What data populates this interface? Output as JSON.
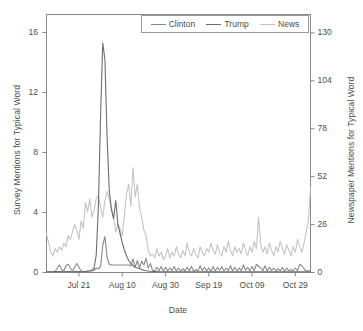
{
  "chart_data": {
    "type": "line",
    "title": "",
    "xlabel": "Date",
    "ylabel": "Survey Mentions for Typical Word",
    "ylabel_right": "Newspaper Mentions for Typical Word",
    "grid": false,
    "legend_position": "top",
    "xlim": [
      0,
      122
    ],
    "ylim": [
      0,
      17.2
    ],
    "ylim_right": [
      0,
      140
    ],
    "xticks": [
      {
        "value": 15,
        "label": "Jul 21"
      },
      {
        "value": 35,
        "label": "Aug 10"
      },
      {
        "value": 55,
        "label": "Aug 30"
      },
      {
        "value": 75,
        "label": "Sep 19"
      },
      {
        "value": 95,
        "label": "Oct 09"
      },
      {
        "value": 115,
        "label": "Oct 29"
      }
    ],
    "yticks_left": [
      {
        "value": 0,
        "label": "0"
      },
      {
        "value": 4,
        "label": "4"
      },
      {
        "value": 8,
        "label": "8"
      },
      {
        "value": 12,
        "label": "12"
      },
      {
        "value": 16,
        "label": "16"
      }
    ],
    "yticks_right": [
      {
        "value": 0,
        "label": "0"
      },
      {
        "value": 26,
        "label": "26"
      },
      {
        "value": 52,
        "label": "52"
      },
      {
        "value": 78,
        "label": "78"
      },
      {
        "value": 104,
        "label": "104"
      },
      {
        "value": 130,
        "label": "130"
      }
    ],
    "series": [
      {
        "name": "Clinton",
        "color": "#8a8a8a",
        "axis": "left",
        "x": [
          0,
          1,
          2,
          3,
          4,
          5,
          6,
          7,
          8,
          9,
          10,
          11,
          12,
          13,
          14,
          15,
          16,
          17,
          18,
          19,
          20,
          21,
          22,
          23,
          24,
          25,
          26,
          27,
          28,
          29,
          30,
          31,
          32,
          33,
          34,
          35,
          36,
          37,
          38,
          39,
          40,
          41,
          42,
          43,
          44,
          45,
          46,
          47,
          48,
          49,
          50,
          51,
          52,
          53,
          54,
          55,
          56,
          57,
          58,
          59,
          60,
          61,
          62,
          63,
          64,
          65,
          66,
          67,
          68,
          69,
          70,
          71,
          72,
          73,
          74,
          75,
          76,
          77,
          78,
          79,
          80,
          81,
          82,
          83,
          84,
          85,
          86,
          87,
          88,
          89,
          90,
          91,
          92,
          93,
          94,
          95,
          96,
          97,
          98,
          99,
          100,
          101,
          102,
          103,
          104,
          105,
          106,
          107,
          108,
          109,
          110,
          111,
          112,
          113,
          114,
          115,
          116,
          117,
          118,
          119,
          120,
          121,
          122
        ],
        "values": [
          0.05,
          0.05,
          0.06,
          0.05,
          0.08,
          0.3,
          0.5,
          0.2,
          0.1,
          0.45,
          0.55,
          0.3,
          0.1,
          0.35,
          0.6,
          0.35,
          0.1,
          0.08,
          0.07,
          0.1,
          0.12,
          0.1,
          0.15,
          0.3,
          0.25,
          0.4,
          1.8,
          2.4,
          1.0,
          0.55,
          0.5,
          0.5,
          0.5,
          0.5,
          0.5,
          0.5,
          0.5,
          0.5,
          0.5,
          0.45,
          0.9,
          0.35,
          0.8,
          0.3,
          0.75,
          0.5,
          0.95,
          0.3,
          0.6,
          0.15,
          0.1,
          0.35,
          0.12,
          0.4,
          0.1,
          0.35,
          0.08,
          0.3,
          0.12,
          0.4,
          0.1,
          0.3,
          0.08,
          0.25,
          0.1,
          0.35,
          0.12,
          0.4,
          0.1,
          0.2,
          0.1,
          0.45,
          0.12,
          0.35,
          0.1,
          0.3,
          0.08,
          0.4,
          0.1,
          0.35,
          0.15,
          0.4,
          0.1,
          0.3,
          0.12,
          0.45,
          0.1,
          0.35,
          0.1,
          0.3,
          0.12,
          0.5,
          0.15,
          0.35,
          0.1,
          0.4,
          0.12,
          0.55,
          0.4,
          0.3,
          0.12,
          0.45,
          0.1,
          0.35,
          0.12,
          0.3,
          0.1,
          0.25,
          0.12,
          0.35,
          0.08,
          0.3,
          0.1,
          0.2,
          0.1,
          0.3,
          0.12,
          0.55,
          0.45,
          0.25,
          0.1,
          0.12,
          0.1
        ]
      },
      {
        "name": "Trump",
        "color": "#6e6e6e",
        "axis": "left",
        "x": [
          0,
          1,
          2,
          3,
          4,
          5,
          6,
          7,
          8,
          9,
          10,
          11,
          12,
          13,
          14,
          15,
          16,
          17,
          18,
          19,
          20,
          21,
          22,
          23,
          24,
          25,
          26,
          27,
          28,
          29,
          30,
          31,
          32,
          33,
          34,
          35,
          36,
          37,
          38,
          39,
          40,
          41,
          42,
          43,
          44,
          45,
          46,
          47,
          48,
          49,
          50,
          51,
          52,
          53,
          54,
          55,
          56,
          57,
          58,
          59,
          60,
          61,
          62,
          63,
          64,
          65,
          66,
          67,
          68,
          69,
          70,
          71,
          72,
          73,
          74,
          75,
          76,
          77,
          78,
          79,
          80,
          81,
          82,
          83,
          84,
          85,
          86,
          87,
          88,
          89,
          90,
          91,
          92,
          93,
          94,
          95,
          96,
          97,
          98,
          99,
          100,
          101,
          102,
          103,
          104,
          105,
          106,
          107,
          108,
          109,
          110,
          111,
          112,
          113,
          114,
          115,
          116,
          117,
          118,
          119,
          120,
          121,
          122
        ],
        "values": [
          0.05,
          0.05,
          0.05,
          0.05,
          0.06,
          0.06,
          0.07,
          0.06,
          0.05,
          0.06,
          0.07,
          0.06,
          0.05,
          0.06,
          0.07,
          0.06,
          0.05,
          0.06,
          0.06,
          0.08,
          0.1,
          0.15,
          0.3,
          1.2,
          4.5,
          10.5,
          15.3,
          14.2,
          9.0,
          5.5,
          4.2,
          3.6,
          4.8,
          3.2,
          2.6,
          2.0,
          1.5,
          1.1,
          0.8,
          0.6,
          0.45,
          0.35,
          0.3,
          0.25,
          0.2,
          0.15,
          0.12,
          0.1,
          0.08,
          0.07,
          0.06,
          0.06,
          0.05,
          0.05,
          0.05,
          0.05,
          0.05,
          0.05,
          0.05,
          0.05,
          0.05,
          0.05,
          0.05,
          0.05,
          0.05,
          0.05,
          0.05,
          0.05,
          0.05,
          0.05,
          0.05,
          0.05,
          0.05,
          0.05,
          0.05,
          0.05,
          0.05,
          0.05,
          0.05,
          0.05,
          0.05,
          0.05,
          0.05,
          0.05,
          0.05,
          0.05,
          0.05,
          0.05,
          0.05,
          0.05,
          0.05,
          0.05,
          0.05,
          0.05,
          0.05,
          0.05,
          0.05,
          0.05,
          0.05,
          0.05,
          0.05,
          0.05,
          0.05,
          0.05,
          0.05,
          0.05,
          0.05,
          0.05,
          0.05,
          0.05,
          0.05,
          0.05,
          0.05,
          0.05,
          0.05,
          0.05,
          0.05,
          0.05,
          0.05,
          0.05,
          0.05,
          0.05,
          0.05
        ]
      },
      {
        "name": "News",
        "color": "#c4c4c4",
        "axis": "right",
        "x": [
          0,
          1,
          2,
          3,
          4,
          5,
          6,
          7,
          8,
          9,
          10,
          11,
          12,
          13,
          14,
          15,
          16,
          17,
          18,
          19,
          20,
          21,
          22,
          23,
          24,
          25,
          26,
          27,
          28,
          29,
          30,
          31,
          32,
          33,
          34,
          35,
          36,
          37,
          38,
          39,
          40,
          41,
          42,
          43,
          44,
          45,
          46,
          47,
          48,
          49,
          50,
          51,
          52,
          53,
          54,
          55,
          56,
          57,
          58,
          59,
          60,
          61,
          62,
          63,
          64,
          65,
          66,
          67,
          68,
          69,
          70,
          71,
          72,
          73,
          74,
          75,
          76,
          77,
          78,
          79,
          80,
          81,
          82,
          83,
          84,
          85,
          86,
          87,
          88,
          89,
          90,
          91,
          92,
          93,
          94,
          95,
          96,
          97,
          98,
          99,
          100,
          101,
          102,
          103,
          104,
          105,
          106,
          107,
          108,
          109,
          110,
          111,
          112,
          113,
          114,
          115,
          116,
          117,
          118,
          119,
          120,
          121,
          122
        ],
        "values": [
          21,
          16,
          11,
          9,
          13,
          11,
          14,
          12,
          16,
          14,
          20,
          18,
          22,
          26,
          23,
          18,
          28,
          24,
          38,
          33,
          40,
          30,
          34,
          40,
          42,
          35,
          30,
          39,
          44,
          40,
          35,
          30,
          22,
          26,
          24,
          20,
          31,
          43,
          48,
          36,
          57,
          41,
          48,
          35,
          30,
          23,
          20,
          12,
          9,
          10,
          8,
          13,
          9,
          11,
          7,
          9,
          13,
          8,
          11,
          9,
          14,
          10,
          8,
          12,
          9,
          16,
          11,
          9,
          13,
          10,
          8,
          14,
          11,
          9,
          13,
          11,
          16,
          12,
          10,
          15,
          11,
          9,
          14,
          11,
          17,
          12,
          9,
          14,
          11,
          13,
          10,
          16,
          12,
          9,
          14,
          11,
          17,
          13,
          30,
          15,
          11,
          14,
          10,
          16,
          12,
          9,
          14,
          11,
          17,
          13,
          10,
          15,
          12,
          9,
          14,
          11,
          18,
          14,
          11,
          16,
          22,
          28,
          46
        ]
      }
    ],
    "annotations": []
  },
  "legend": {
    "items": [
      {
        "label": "Clinton",
        "color": "#8a8a8a"
      },
      {
        "label": "Trump",
        "color": "#6e6e6e"
      },
      {
        "label": "News",
        "color": "#c4c4c4"
      }
    ]
  }
}
